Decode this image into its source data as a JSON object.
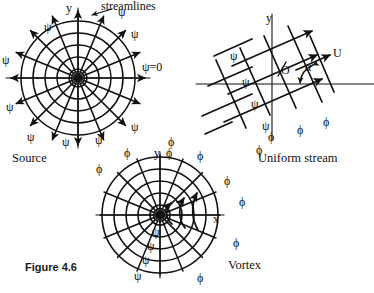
{
  "figure": {
    "caption": "Figure 4.6",
    "annotation_top": "streamlines"
  },
  "panels": {
    "source": {
      "title": "Source",
      "axis_y": "y",
      "stream_zero": "ψ=0",
      "stream_symbol": "ψ",
      "potential_symbol": "ϕ",
      "stream_labels": [
        "ψ",
        "ψ",
        "ψ",
        "ψ",
        "ψ",
        "ψ",
        "ψ",
        "ψ",
        "ψ"
      ],
      "potential_labels": [
        "ϕ"
      ]
    },
    "uniform_stream": {
      "title": "Uniform stream",
      "axis_y": "y",
      "velocity_label": "U",
      "angle_label": "α",
      "origin_label": "O",
      "stream_labels": [
        "ψ",
        "ψ",
        "ψ",
        "ψ"
      ],
      "potential_labels": [
        "ϕ",
        "ϕ",
        "ϕ",
        "ϕ"
      ]
    },
    "vortex": {
      "title": "Vortex",
      "axis_y": "y",
      "axis_x": "x",
      "stream_labels": [
        "ψ",
        "ψ",
        "ψ",
        "ψ"
      ],
      "potential_labels": [
        "ϕ",
        "ϕ",
        "ϕ",
        "ϕ",
        "ϕ",
        "ϕ",
        "ϕ",
        "ϕ"
      ]
    }
  },
  "colors": {
    "ink": "#111111",
    "background": "#ffffff"
  }
}
